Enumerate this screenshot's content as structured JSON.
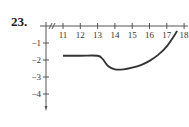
{
  "problem": {
    "number": "23."
  },
  "colors": {
    "axis": "#555555",
    "curve": "#333333",
    "text": "#333333"
  },
  "chart_data": {
    "type": "line",
    "title": "",
    "xlabel": "",
    "ylabel": "",
    "x_axis_break": true,
    "xticks": [
      11,
      12,
      13,
      14,
      15,
      16,
      17,
      18
    ],
    "yticks": [
      -1,
      -2,
      -3,
      -4
    ],
    "xlim": [
      10,
      18
    ],
    "ylim": [
      -5,
      0
    ],
    "grid": false,
    "series": [
      {
        "name": "f(x)",
        "points": [
          [
            11,
            -1.75
          ],
          [
            12,
            -1.75
          ],
          [
            13,
            -1.75
          ],
          [
            13.3,
            -1.95
          ],
          [
            13.6,
            -2.35
          ],
          [
            14.0,
            -2.55
          ],
          [
            14.5,
            -2.55
          ],
          [
            15.0,
            -2.45
          ],
          [
            15.5,
            -2.3
          ],
          [
            16.0,
            -2.05
          ],
          [
            16.5,
            -1.7
          ],
          [
            17.0,
            -1.2
          ],
          [
            17.6,
            -0.3
          ]
        ]
      }
    ]
  }
}
